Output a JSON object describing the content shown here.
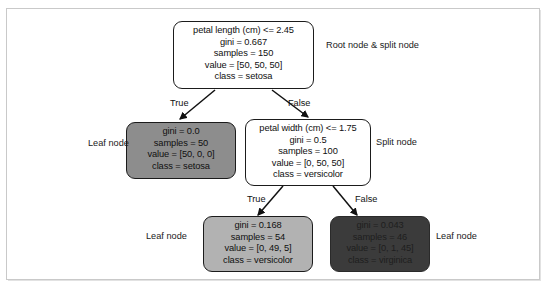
{
  "figure": {
    "type": "decision-tree-diagram",
    "background_color": "#ffffff",
    "frame_color": "#c9c9c9"
  },
  "nodes": [
    {
      "id": "root",
      "role": "root-and-split-node",
      "fill": "#ffffff",
      "text_color": "#101010",
      "lines": [
        "petal length (cm) <= 2.45",
        "gini = 0.667",
        "samples = 150",
        "value = [50, 50, 50]",
        "class = setosa"
      ],
      "feature": "petal length (cm)",
      "threshold": 2.45,
      "gini": 0.667,
      "samples": 150,
      "value": [
        50,
        50,
        50
      ],
      "class": "setosa"
    },
    {
      "id": "leaf-setosa",
      "role": "leaf-node",
      "fill": "#8d8d8d",
      "text_color": "#101010",
      "lines": [
        "gini = 0.0",
        "samples = 50",
        "value = [50, 0, 0]",
        "class = setosa"
      ],
      "gini": 0.0,
      "samples": 50,
      "value": [
        50,
        0,
        0
      ],
      "class": "setosa"
    },
    {
      "id": "split-petal-width",
      "role": "split-node",
      "fill": "#ffffff",
      "text_color": "#101010",
      "lines": [
        "petal width (cm) <= 1.75",
        "gini = 0.5",
        "samples = 100",
        "value = [0, 50, 50]",
        "class = versicolor"
      ],
      "feature": "petal width (cm)",
      "threshold": 1.75,
      "gini": 0.5,
      "samples": 100,
      "value": [
        0,
        50,
        50
      ],
      "class": "versicolor"
    },
    {
      "id": "leaf-versicolor",
      "role": "leaf-node",
      "fill": "#b2b2b2",
      "text_color": "#101010",
      "lines": [
        "gini = 0.168",
        "samples = 54",
        "value = [0, 49, 5]",
        "class = versicolor"
      ],
      "gini": 0.168,
      "samples": 54,
      "value": [
        0,
        49,
        5
      ],
      "class": "versicolor"
    },
    {
      "id": "leaf-virginica",
      "role": "leaf-node",
      "fill": "#3b3b3b",
      "text_color": "#1e1e1e",
      "lines": [
        "gini = 0.043",
        "samples = 46",
        "value = [0, 1, 45]",
        "class = virginica"
      ],
      "gini": 0.043,
      "samples": 46,
      "value": [
        0,
        1,
        45
      ],
      "class": "virginica"
    }
  ],
  "edges": [
    {
      "id": "root-true",
      "label": "True",
      "from": "root",
      "to": "leaf-setosa"
    },
    {
      "id": "root-false",
      "label": "False",
      "from": "root",
      "to": "split-petal-width"
    },
    {
      "id": "split-true",
      "label": "True",
      "from": "split-petal-width",
      "to": "leaf-versicolor"
    },
    {
      "id": "split-false",
      "label": "False",
      "from": "split-petal-width",
      "to": "leaf-virginica"
    }
  ],
  "callouts": [
    {
      "id": "callout-root",
      "line1": "Root node",
      "line2": "& split node"
    },
    {
      "id": "callout-leaf-left",
      "line1": "Leaf",
      "line2": "node"
    },
    {
      "id": "callout-split-right",
      "line1": "Split",
      "line2": "node"
    },
    {
      "id": "callout-leaf-bottom-left",
      "line1": "Leaf",
      "line2": "node"
    },
    {
      "id": "callout-leaf-bottom-right",
      "line1": "Leaf",
      "line2": "node"
    }
  ]
}
